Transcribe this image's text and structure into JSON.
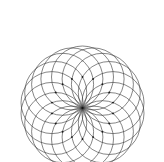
{
  "figure": {
    "kind": "geometric-line-figure",
    "canvas": {
      "width": 164,
      "height": 162,
      "background_color": "#ffffff"
    },
    "style": {
      "stroke_color": "#3a3a3a",
      "stroke_width": 0.62,
      "dot_color": "#1a1a1a",
      "dot_radius": 0.95,
      "fill": "none"
    },
    "construction": {
      "description": "18 equal circles whose centers lie evenly spaced on a ring; every circle passes through one common convergence point.",
      "circle_count": 18,
      "circle_radius": 31,
      "center_ring_radius": 31,
      "convergence_point": {
        "x": 82.5,
        "y": 108
      },
      "ring_center": {
        "x": 82.5,
        "y": 108
      },
      "start_angle_deg": -90,
      "angle_step_deg": 20,
      "bounds": {
        "left": 11,
        "top": 5,
        "right": 154,
        "bottom": 157
      }
    },
    "circle_centers": [
      {
        "index": 0,
        "angle_deg": -90,
        "x": 82.5,
        "y": 77.0
      },
      {
        "index": 1,
        "angle_deg": -70,
        "x": 93.1,
        "y": 78.9
      },
      {
        "index": 2,
        "angle_deg": -50,
        "x": 102.4,
        "y": 84.3
      },
      {
        "index": 3,
        "angle_deg": -30,
        "x": 109.3,
        "y": 92.5
      },
      {
        "index": 4,
        "angle_deg": -10,
        "x": 113.0,
        "y": 102.6
      },
      {
        "index": 5,
        "angle_deg": 10,
        "x": 113.0,
        "y": 113.4
      },
      {
        "index": 6,
        "angle_deg": 30,
        "x": 109.3,
        "y": 123.5
      },
      {
        "index": 7,
        "angle_deg": 50,
        "x": 102.4,
        "y": 131.7
      },
      {
        "index": 8,
        "angle_deg": 70,
        "x": 93.1,
        "y": 137.1
      },
      {
        "index": 9,
        "angle_deg": 90,
        "x": 82.5,
        "y": 139.0
      },
      {
        "index": 10,
        "angle_deg": 110,
        "x": 71.9,
        "y": 137.1
      },
      {
        "index": 11,
        "angle_deg": 130,
        "x": 62.6,
        "y": 131.7
      },
      {
        "index": 12,
        "angle_deg": 150,
        "x": 55.7,
        "y": 123.5
      },
      {
        "index": 13,
        "angle_deg": 170,
        "x": 52.0,
        "y": 113.4
      },
      {
        "index": 14,
        "angle_deg": 190,
        "x": 52.0,
        "y": 102.6
      },
      {
        "index": 15,
        "angle_deg": 210,
        "x": 55.7,
        "y": 92.5
      },
      {
        "index": 16,
        "angle_deg": 230,
        "x": 62.6,
        "y": 84.3
      },
      {
        "index": 17,
        "angle_deg": 250,
        "x": 71.9,
        "y": 78.9
      }
    ]
  }
}
